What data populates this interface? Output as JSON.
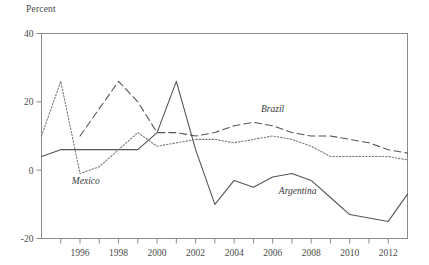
{
  "chart_data": {
    "type": "line",
    "title": "",
    "ylabel": "Percent",
    "xlabel": "",
    "ylim": [
      -20,
      40
    ],
    "xlim": [
      1994,
      2013
    ],
    "grid": false,
    "legend_position": "inline-annotations",
    "y_ticks": [
      -20,
      0,
      20,
      40
    ],
    "y_tick_labels": [
      "-20",
      "0",
      "20",
      "40"
    ],
    "x_ticks": [
      1994,
      1995,
      1996,
      1997,
      1998,
      1999,
      2000,
      2001,
      2002,
      2003,
      2004,
      2005,
      2006,
      2007,
      2008,
      2009,
      2010,
      2011,
      2012,
      2013
    ],
    "x_tick_labels": [
      "1996",
      "1998",
      "2000",
      "2002",
      "2004",
      "2006",
      "2008",
      "2010",
      "2012"
    ],
    "x_labeled_ticks": [
      1996,
      1998,
      2000,
      2002,
      2004,
      2006,
      2008,
      2010,
      2012
    ],
    "series": [
      {
        "name": "Argentina",
        "style": "solid",
        "color": "#555555",
        "x": [
          1994,
          1995,
          1996,
          1997,
          1998,
          1999,
          2000,
          2001,
          2002,
          2003,
          2004,
          2005,
          2006,
          2007,
          2008,
          2009,
          2010,
          2011,
          2012,
          2013
        ],
        "values": [
          4,
          6,
          6,
          6,
          6,
          6,
          11,
          26,
          6,
          -10,
          -3,
          -5,
          -2,
          -1,
          -3,
          -8,
          -13,
          -14,
          -15,
          -7
        ]
      },
      {
        "name": "Brazil",
        "style": "dashed",
        "color": "#555555",
        "x": [
          1996,
          1997,
          1998,
          1999,
          2000,
          2001,
          2002,
          2003,
          2004,
          2005,
          2006,
          2007,
          2008,
          2009,
          2010,
          2011,
          2012,
          2013
        ],
        "values": [
          10,
          18,
          26,
          20,
          11,
          11,
          10,
          11,
          13,
          14,
          13,
          11,
          10,
          10,
          9,
          8,
          6,
          5
        ]
      },
      {
        "name": "Mexico",
        "style": "dotted",
        "color": "#777777",
        "x": [
          1994,
          1995,
          1996,
          1997,
          1998,
          1999,
          2000,
          2001,
          2002,
          2003,
          2004,
          2005,
          2006,
          2007,
          2008,
          2009,
          2010,
          2011,
          2012,
          2013
        ],
        "values": [
          10,
          26,
          -1,
          1,
          6,
          11,
          7,
          8,
          9,
          9,
          8,
          9,
          10,
          9,
          7,
          4,
          4,
          4,
          4,
          3
        ]
      }
    ],
    "annotations": [
      {
        "text": "Brazil",
        "x": 2006,
        "y": 17
      },
      {
        "text": "Mexico",
        "x": 1996.3,
        "y": -4
      },
      {
        "text": "Argentina",
        "x": 2007.3,
        "y": -7
      }
    ]
  }
}
